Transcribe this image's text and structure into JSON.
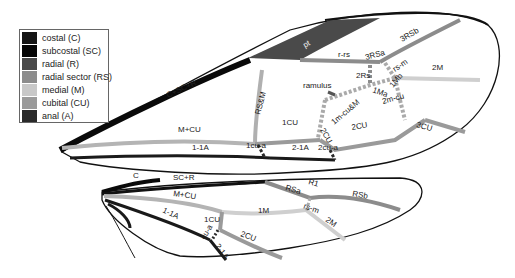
{
  "figure": {
    "type": "insect wing venation diagram",
    "wings": [
      "forewing",
      "hindwing"
    ]
  },
  "legend": {
    "items": [
      {
        "label": "costal (C)",
        "color": "#151515"
      },
      {
        "label": "subcostal (SC)",
        "color": "#050505"
      },
      {
        "label": "radial (R)",
        "color": "#4a4a4a"
      },
      {
        "label": "radial sector (RS)",
        "color": "#8c8c8c"
      },
      {
        "label": "medial (M)",
        "color": "#c8c8c8"
      },
      {
        "label": "cubital (CU)",
        "color": "#9a9a9a"
      },
      {
        "label": "anal (A)",
        "color": "#2a2a2a"
      }
    ]
  },
  "forewing": {
    "labels": {
      "csr": "C+SC+R",
      "pt": "pt",
      "rrs": "r-rs",
      "rs3a": "3RSa",
      "rs3b": "3RSb",
      "rsm": "rs-m",
      "rs2": "2Rs",
      "m2": "2M",
      "ramulus": "ramulus",
      "ma1": "1Ma",
      "mb1": "1Mb",
      "rsandm": "RS&M",
      "mcucm": "1m-cu&M",
      "mcu2": "2m-cu",
      "mcu": "M+CU",
      "cu1": "1CU",
      "cu2a": "2CU",
      "cu2b": "2CU",
      "cu3": "3CU",
      "a11": "1-1A",
      "cua1": "1cu-a",
      "a21": "2-1A",
      "cua2": "2cu-a"
    }
  },
  "hindwing": {
    "labels": {
      "c": "C",
      "scr": "SC+R",
      "rsa": "RSa",
      "r1": "R1",
      "rsb": "RSb",
      "mcu": "M+CU",
      "rsm": "rs-m",
      "m1": "1M",
      "m2": "2M",
      "a11": "1-1A",
      "cu1": "1CU",
      "cua": "cu-a",
      "cu2": "2CU",
      "a21": "2-1A"
    }
  }
}
